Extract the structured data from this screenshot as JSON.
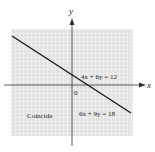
{
  "diagram": {
    "axes": {
      "x_label": "x",
      "y_label": "y",
      "origin_label": "0"
    },
    "equations": [
      "4x + 6y = 12",
      "6x + 9y = 18"
    ],
    "annotation": "Coincide",
    "colors": {
      "grid_bg": "#e6e6e6",
      "grid_line": "#ffffff",
      "axis": "#333333",
      "line": "#1a1a1a"
    }
  }
}
